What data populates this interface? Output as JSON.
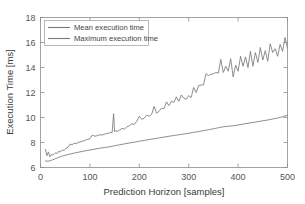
{
  "chart_data": {
    "type": "line",
    "title": "",
    "xlabel": "Prediction Horizon [samples]",
    "ylabel": "Execution Time [ms]",
    "xlim": [
      0,
      500
    ],
    "ylim": [
      6,
      18
    ],
    "xticks": [
      0,
      100,
      200,
      300,
      400,
      500
    ],
    "yticks": [
      6,
      8,
      10,
      12,
      14,
      16,
      18
    ],
    "xtick_labels": [
      "0",
      "100",
      "200",
      "300",
      "400",
      "500"
    ],
    "ytick_labels": [
      "6",
      "8",
      "10",
      "12",
      "14",
      "16",
      "18"
    ],
    "grid": false,
    "legend_position": "upper-left",
    "series": [
      {
        "name": "Mean execution time",
        "color": "#7a7a7a",
        "x": [
          10,
          15,
          20,
          25,
          30,
          35,
          40,
          45,
          50,
          60,
          70,
          80,
          90,
          100,
          110,
          120,
          130,
          140,
          150,
          160,
          170,
          180,
          190,
          200,
          210,
          220,
          230,
          240,
          250,
          260,
          270,
          280,
          290,
          300,
          310,
          320,
          330,
          340,
          350,
          360,
          370,
          380,
          390,
          400,
          410,
          420,
          430,
          440,
          450,
          460,
          470,
          480,
          490,
          500
        ],
        "values": [
          6.52,
          6.5,
          6.55,
          6.62,
          6.7,
          6.78,
          6.86,
          6.92,
          6.98,
          7.08,
          7.17,
          7.25,
          7.33,
          7.4,
          7.47,
          7.54,
          7.6,
          7.66,
          7.74,
          7.82,
          7.89,
          7.96,
          8.03,
          8.1,
          8.17,
          8.24,
          8.3,
          8.37,
          8.43,
          8.5,
          8.56,
          8.62,
          8.68,
          8.74,
          8.81,
          8.88,
          8.95,
          9.02,
          9.1,
          9.18,
          9.26,
          9.3,
          9.34,
          9.4,
          9.47,
          9.54,
          9.6,
          9.67,
          9.74,
          9.8,
          9.88,
          9.96,
          10.06,
          10.18
        ]
      },
      {
        "name": "Maximum execution time",
        "color": "#7a7a7a",
        "x": [
          10,
          13,
          16,
          19,
          22,
          25,
          28,
          31,
          34,
          37,
          40,
          44,
          48,
          52,
          56,
          60,
          64,
          68,
          72,
          76,
          80,
          85,
          90,
          95,
          100,
          105,
          110,
          115,
          120,
          125,
          130,
          135,
          140,
          145,
          148,
          150,
          152,
          155,
          160,
          165,
          170,
          175,
          180,
          185,
          190,
          195,
          200,
          205,
          210,
          215,
          220,
          225,
          230,
          235,
          240,
          245,
          250,
          255,
          260,
          265,
          270,
          275,
          280,
          285,
          290,
          295,
          300,
          305,
          310,
          315,
          320,
          325,
          330,
          335,
          340,
          345,
          350,
          355,
          360,
          365,
          370,
          375,
          380,
          385,
          390,
          395,
          400,
          405,
          410,
          415,
          420,
          425,
          430,
          435,
          440,
          445,
          450,
          455,
          460,
          465,
          470,
          475,
          480,
          485,
          490,
          495,
          500
        ],
        "values": [
          7.45,
          6.95,
          7.25,
          6.85,
          7.05,
          7.0,
          7.1,
          7.18,
          7.12,
          7.3,
          7.25,
          7.4,
          7.38,
          7.55,
          7.62,
          7.88,
          7.8,
          7.95,
          7.9,
          8.0,
          8.05,
          8.1,
          8.18,
          8.25,
          8.3,
          8.6,
          8.5,
          8.55,
          8.62,
          8.6,
          8.68,
          8.72,
          8.78,
          8.8,
          10.3,
          8.85,
          8.95,
          8.88,
          9.0,
          9.12,
          9.08,
          9.25,
          9.35,
          9.5,
          9.45,
          9.7,
          10.1,
          9.85,
          9.95,
          10.2,
          10.1,
          10.25,
          10.9,
          10.35,
          10.5,
          10.75,
          10.7,
          11.25,
          10.95,
          11.3,
          11.2,
          11.65,
          11.3,
          11.8,
          11.55,
          11.45,
          11.75,
          11.6,
          12.4,
          12.0,
          12.55,
          12.6,
          12.6,
          13.5,
          13.35,
          13.45,
          13.5,
          13.6,
          13.55,
          14.65,
          13.6,
          14.1,
          13.7,
          14.7,
          13.25,
          14.2,
          13.7,
          14.9,
          14.1,
          14.85,
          14.0,
          15.3,
          14.1,
          15.2,
          14.4,
          15.6,
          14.6,
          15.35,
          14.5,
          15.9,
          15.2,
          15.5,
          14.9,
          15.85,
          15.3,
          16.4,
          15.55
        ]
      }
    ]
  },
  "axes": {
    "xlabel": "Prediction Horizon [samples]",
    "ylabel": "Execution Time [ms]"
  },
  "legend": {
    "items": [
      {
        "label": "Mean execution time"
      },
      {
        "label": "Maximum execution time"
      }
    ]
  },
  "colors": {
    "mean_line": "#7a7a7a",
    "max_line": "#7a7a7a",
    "axis": "#8d8d8d",
    "text": "#555555",
    "background": "#ffffff"
  }
}
